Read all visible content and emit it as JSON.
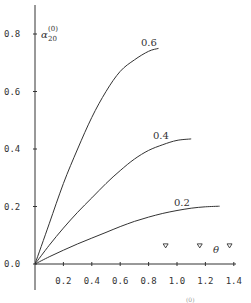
{
  "chart_data": {
    "type": "line",
    "title": "",
    "xlabel": "θ",
    "ylabel": "α₂₀⁽⁰⁾",
    "ylabel_main": "α",
    "ylabel_sub": "20",
    "ylabel_sup": "(0)",
    "xlim": [
      0,
      1.4
    ],
    "ylim": [
      0,
      0.8
    ],
    "grid": false,
    "legend": "inline curve labels",
    "x_ticks": [
      "0.2",
      "0.4",
      "0.6",
      "0.8",
      "1.0",
      "1.2",
      "1.4"
    ],
    "y_ticks": [
      "0.0",
      "0.2",
      "0.4",
      "0.6",
      "0.8"
    ],
    "series": [
      {
        "name": "0.6",
        "x": [
          0,
          0.1,
          0.2,
          0.3,
          0.4,
          0.5,
          0.6,
          0.7,
          0.8,
          0.87
        ],
        "values": [
          0,
          0.14,
          0.28,
          0.4,
          0.51,
          0.6,
          0.67,
          0.71,
          0.74,
          0.75
        ]
      },
      {
        "name": "0.4",
        "x": [
          0,
          0.1,
          0.2,
          0.3,
          0.4,
          0.5,
          0.6,
          0.7,
          0.8,
          0.9,
          1.0,
          1.1
        ],
        "values": [
          0,
          0.065,
          0.125,
          0.18,
          0.23,
          0.28,
          0.325,
          0.365,
          0.395,
          0.415,
          0.43,
          0.435
        ]
      },
      {
        "name": "0.2",
        "x": [
          0,
          0.1,
          0.2,
          0.3,
          0.4,
          0.5,
          0.6,
          0.7,
          0.8,
          0.9,
          1.0,
          1.1,
          1.2,
          1.3
        ],
        "values": [
          0,
          0.025,
          0.048,
          0.07,
          0.09,
          0.11,
          0.13,
          0.148,
          0.163,
          0.176,
          0.186,
          0.194,
          0.199,
          0.201
        ]
      }
    ],
    "markers": {
      "shape": "triangle-down",
      "x": [
        0.92,
        1.16,
        1.37
      ],
      "y": [
        0.063,
        0.063,
        0.063
      ]
    },
    "annotations": [
      "0.6",
      "0.4",
      "0.2",
      "θ"
    ]
  },
  "labels": {
    "x_ticks": [
      "0.2",
      "0.4",
      "0.6",
      "0.8",
      "1.0",
      "1.2",
      "1.4"
    ],
    "y_ticks": [
      "0.0",
      "0.2",
      "0.4",
      "0.6",
      "0.8"
    ],
    "curve_06": "0.6",
    "curve_04": "0.4",
    "curve_02": "0.2",
    "x_title": "θ",
    "y_title_main": "α",
    "y_title_sub": "20",
    "y_title_sup": "(0)",
    "caption_fragment": "(0)"
  }
}
